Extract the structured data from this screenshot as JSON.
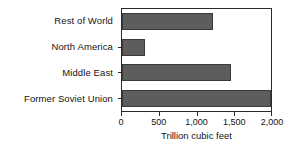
{
  "chart_data": {
    "type": "bar",
    "orientation": "horizontal",
    "title": "",
    "subtitle": "",
    "categories": [
      "Rest of World",
      "North America",
      "Middle East",
      "Former Soviet Union"
    ],
    "values": [
      1200,
      300,
      1450,
      2000
    ],
    "series": [
      {
        "name": "Natural gas reserves",
        "values": [
          1200,
          300,
          1450,
          2000
        ]
      }
    ],
    "xlabel": "Trillion cubic feet",
    "ylabel": "",
    "xlim": [
      0,
      2000
    ],
    "xticks": [
      0,
      500,
      1000,
      1500,
      2000
    ],
    "xtick_labels": [
      "0",
      "500",
      "1,000",
      "1,500",
      "2,000"
    ],
    "grid": false,
    "legend": false,
    "legend_position": "none",
    "bar_color": "#5d5d5d",
    "bar_border_color": "#3a3a3a",
    "frame_color": "#2b2b2b",
    "background_color": "#ffffff"
  },
  "axis": {
    "x_title": "Trillion cubic feet"
  }
}
